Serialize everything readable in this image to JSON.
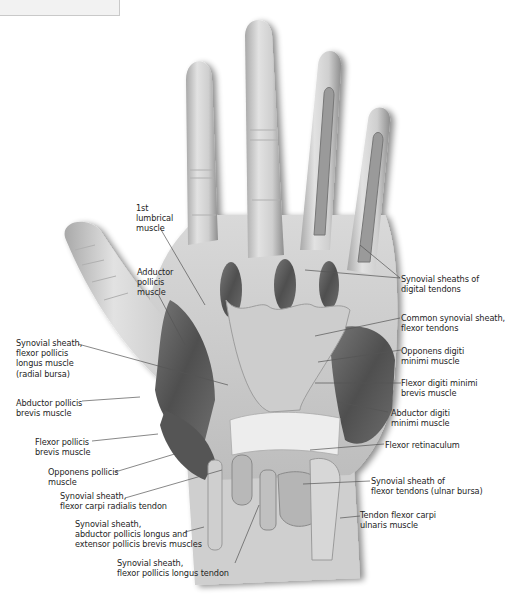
{
  "figure": {
    "header_box": ""
  },
  "labels": {
    "first_lumbrical": "1st\nlumbrical\nmuscle",
    "adductor_pollicis": "Adductor\npollicis\nmuscle",
    "syn_sheath_fpl_radial": "Synovial sheath,\nflexor pollicis\nlongus muscle\n(radial bursa)",
    "abductor_pollicis_brevis": "Abductor pollicis\nbrevis muscle",
    "flexor_pollicis_brevis": "Flexor pollicis\nbrevis muscle",
    "opponens_pollicis": "Opponens pollicis\nmuscle",
    "syn_sheath_fcr": "Synovial sheath,\nflexor carpi radialis tendon",
    "syn_sheath_apl_epb": "Synovial sheath,\nabductor pollicis longus and\nextensor pollicis brevis muscles",
    "syn_sheath_fpl_tendon": "Synovial sheath,\nflexor pollicis longus tendon",
    "syn_sheaths_digital": "Synovial sheaths of\ndigital tendons",
    "common_syn_sheath": "Common synovial sheath,\nflexor tendons",
    "opponens_digiti_minimi": "Opponens digiti\nminimi muscle",
    "flexor_digiti_minimi": "Flexor digiti minimi\nbrevis muscle",
    "abductor_digiti_minimi": "Abductor digiti\nminimi muscle",
    "flexor_retinaculum": "Flexor retinaculum",
    "syn_sheath_ulnar": "Synovial sheath of\nflexor tendons (ulnar bursa)",
    "tendon_fcu": "Tendon flexor carpi\nulnaris muscle"
  },
  "colors": {
    "skin_light": "#dcdcdc",
    "skin_mid": "#b4b4b4",
    "muscle_dark": "#5e5e5e",
    "sheath": "#c8c8c8",
    "leader": "#555555",
    "text": "#1e1e1e"
  }
}
